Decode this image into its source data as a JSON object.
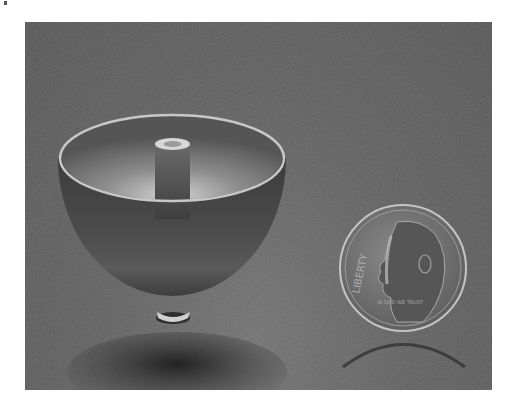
{
  "image": {
    "description": "Photograph of a metallic hemispherical shell with a central post inside, shown beside a US dime for scale",
    "objects": [
      {
        "name": "hemispherical-shell",
        "features": [
          "rim",
          "central-post",
          "base-stem",
          "shadow"
        ]
      },
      {
        "name": "dime",
        "visible_text": [
          "LIBERTY",
          "IN GOD WE TRUST"
        ],
        "date_visible": "199?"
      }
    ],
    "colors": {
      "background": "#5a5a5a",
      "background_light": "#717171",
      "rim_highlight": "#cfcfcf",
      "bowl_dark": "#444444",
      "inner_glow": "#b8b8b8",
      "coin": "#7a7a7a",
      "coin_edge": "#c4c4c4"
    }
  },
  "coin_text": {
    "liberty": "LIBERTY",
    "motto": "IN GOD WE TRUST"
  }
}
